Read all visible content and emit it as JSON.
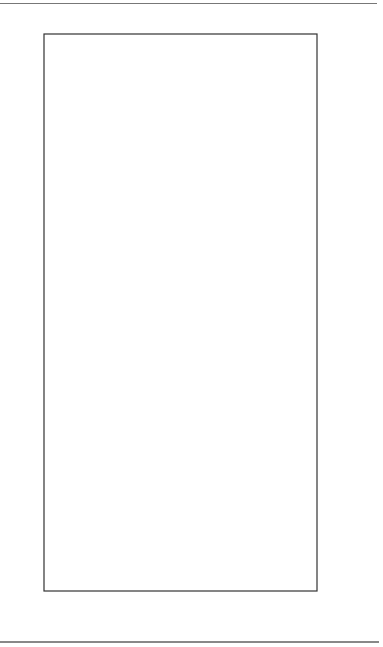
{
  "chart_data": {
    "type": "line",
    "orientation": "rotated-90-ccw",
    "title": "",
    "xlabel": "",
    "ylabel": "",
    "ylim": [
      7,
      10
    ],
    "yticks": [
      "10",
      "9",
      "8",
      "7"
    ],
    "grid": "dashed horizontal (value) gridlines at 9 and 8, solid at 10; alternating gray category bands",
    "legend_position": "top (rotated to left side)",
    "categories": [
      "Personal Computing 8/1/90",
      "PC Magazine 12/11/90",
      "Infoworld 1/7/91",
      "Infoworld 2/10/92",
      "PC Magazine 2/25/92",
      "Computer World 5/24/93",
      "PC Computing 8/1/93",
      "PC Magazine 11/9/93",
      "PC Magazine 2/8/94",
      "PC Magazine 11/21/95",
      "PC Magazine 2/18/97"
    ],
    "category_lines": [
      [
        "Personal",
        "Computing",
        "8/1/90"
      ],
      [
        "PC",
        "Magazine",
        "12/11/90"
      ],
      [
        "Infoworld",
        "1/7/91"
      ],
      [
        "Infoworld",
        "2/10/92"
      ],
      [
        "PC",
        "Magazine",
        "2/25/92"
      ],
      [
        "Computer",
        "World",
        "5/24/93"
      ],
      [
        "PC",
        "Computing",
        "8/1/93"
      ],
      [
        "PC",
        "Magazine",
        "11/9/93"
      ],
      [
        "PC",
        "Magazine",
        "2/8/94"
      ],
      [
        "PC",
        "Magazine",
        "11/21/95"
      ],
      [
        "PC",
        "Magazine",
        "2/18/97"
      ]
    ],
    "series": [
      {
        "name": "Ami Pro",
        "marker": "diamond",
        "values": [
          9.35,
          8.4,
          9.4,
          9.65,
          10.0,
          10.0,
          10.0,
          9.4,
          9.1,
          9.55,
          10.0
        ]
      },
      {
        "name": "MS Word Windows",
        "marker": "triangle",
        "values": [
          10.0,
          10.0,
          10.0,
          10.0,
          10.0,
          9.85,
          9.45,
          10.0,
          10.0,
          10.0,
          10.0
        ]
      },
      {
        "name": "WordPerfect for Windows",
        "marker": "square-cross",
        "values": [
          null,
          null,
          null,
          8.25,
          8.15,
          9.5,
          8.0,
          9.7,
          10.0,
          9.3,
          10.0
        ]
      }
    ]
  },
  "legend": {
    "items": [
      {
        "label": "Ami Pro",
        "icon": "diamond-icon"
      },
      {
        "label": "MS Word Windows",
        "icon": "triangle-icon"
      },
      {
        "label": "WordPerfect for Windows",
        "icon": "square-cross-icon"
      }
    ]
  },
  "colors": {
    "band": "#d2d2d2",
    "line": "#1a1a1a",
    "grid": "#888888"
  }
}
